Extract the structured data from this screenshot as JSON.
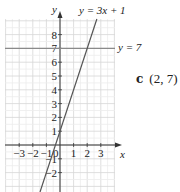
{
  "chart_data": {
    "type": "line",
    "title": "",
    "xlabel": "x",
    "ylabel": "y",
    "xlim": [
      -4,
      4
    ],
    "ylim": [
      -3.4,
      9.1
    ],
    "grid": true,
    "x_ticks": [
      -3,
      -2,
      -1,
      1,
      2,
      3
    ],
    "y_ticks": [
      -2,
      -1,
      1,
      2,
      3,
      4,
      5,
      6,
      7,
      8
    ],
    "origin_label": "0",
    "series": [
      {
        "name": "y = 3x + 1",
        "slope": 3,
        "intercept": 1,
        "color": "#555555"
      },
      {
        "name": "y = 7",
        "slope": 0,
        "intercept": 7,
        "color": "#888888"
      }
    ],
    "intersection": {
      "x": 2,
      "y": 7
    },
    "annotations": [
      {
        "text": "y = 3x + 1",
        "position": "top, right of y-axis"
      },
      {
        "text": "y = 7",
        "position": "right end of horizontal line"
      }
    ]
  },
  "labels": {
    "x_axis": "x",
    "y_axis": "y",
    "line1": "y = 3x + 1",
    "line2": "y = 7",
    "origin": "0"
  },
  "answer": {
    "part": "c",
    "value": "(2, 7)"
  },
  "colors": {
    "grid": "#d6d6d6",
    "axis": "#333333",
    "line1": "#555555",
    "line2": "#8a8a8a"
  }
}
